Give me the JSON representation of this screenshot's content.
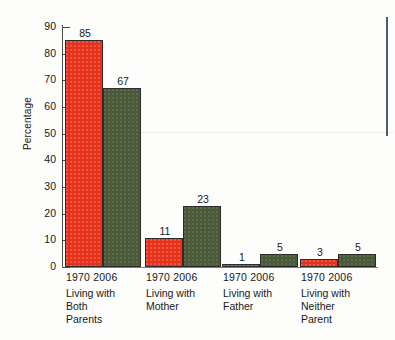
{
  "chart_data": {
    "type": "bar",
    "title": "",
    "subtitle": "",
    "xlabel": "",
    "ylabel": "Percentage",
    "ylim": [
      0,
      90
    ],
    "yticks": [
      0,
      10,
      20,
      30,
      40,
      50,
      60,
      70,
      80,
      90
    ],
    "grid": false,
    "legend": "none",
    "categories": [
      "Living with Both Parents",
      "Living with Mother",
      "Living with Father",
      "Living with Neither Parent"
    ],
    "series": [
      {
        "name": "1970",
        "color": "#e8331c",
        "values": [
          85,
          11,
          1,
          3
        ]
      },
      {
        "name": "2006",
        "color": "#4b5a39",
        "values": [
          67,
          23,
          5,
          5
        ]
      }
    ]
  },
  "axis": {
    "y_title": "Percentage",
    "y_tick_labels": [
      "90",
      "80",
      "70",
      "60",
      "50",
      "40",
      "30",
      "20",
      "10",
      "0"
    ]
  },
  "groups": [
    {
      "years": "1970 2006",
      "name_lines": [
        "Living with",
        "Both",
        "Parents"
      ],
      "bars": [
        {
          "series": "1970",
          "value": 85,
          "label": "85"
        },
        {
          "series": "2006",
          "value": 67,
          "label": "67"
        }
      ]
    },
    {
      "years": "1970 2006",
      "name_lines": [
        "Living with",
        "Mother"
      ],
      "bars": [
        {
          "series": "1970",
          "value": 11,
          "label": "11"
        },
        {
          "series": "2006",
          "value": 23,
          "label": "23"
        }
      ]
    },
    {
      "years": "1970 2006",
      "name_lines": [
        "Living with",
        "Father"
      ],
      "bars": [
        {
          "series": "1970",
          "value": 1,
          "label": "1"
        },
        {
          "series": "2006",
          "value": 5,
          "label": "5"
        }
      ]
    },
    {
      "years": "1970 2006",
      "name_lines": [
        "Living with",
        "Neither",
        "Parent"
      ],
      "bars": [
        {
          "series": "1970",
          "value": 3,
          "label": "3"
        },
        {
          "series": "2006",
          "value": 5,
          "label": "5"
        }
      ]
    }
  ],
  "colors": {
    "series_1970": "#e8331c",
    "series_2006": "#4b5a39",
    "axis": "#4a4a4a",
    "text": "#181818",
    "edge_rule": "#4a6270"
  }
}
